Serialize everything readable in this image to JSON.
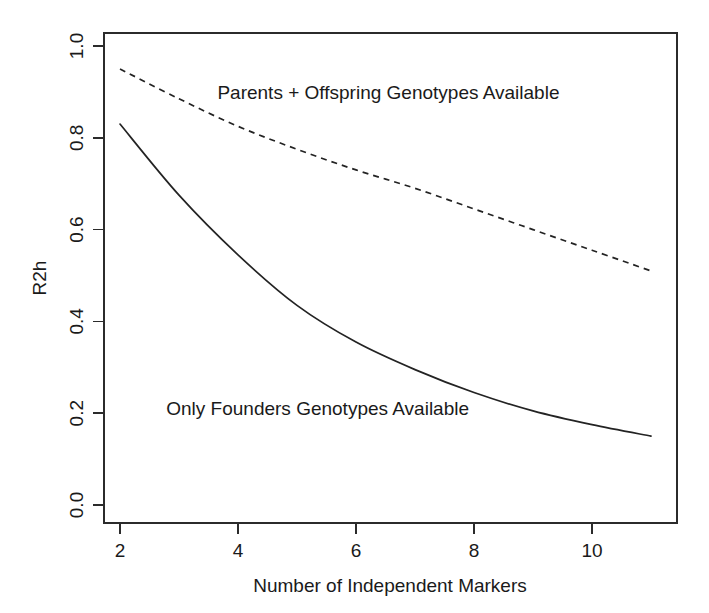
{
  "chart_data": {
    "type": "line",
    "title": "",
    "subtitle": "",
    "xlabel": "Number of Independent Markers",
    "ylabel": "R2h",
    "xlim": [
      1.85,
      11.0
    ],
    "ylim": [
      0.0,
      1.05
    ],
    "xticks": [
      2,
      4,
      6,
      8,
      10
    ],
    "xtick_labels": [
      "2",
      "4",
      "6",
      "8",
      "10"
    ],
    "yticks": [
      0.0,
      0.2,
      0.4,
      0.6,
      0.8,
      1.0
    ],
    "ytick_labels": [
      "0.0",
      "0.2",
      "0.4",
      "0.6",
      "0.8",
      "1.0"
    ],
    "grid": false,
    "legend_position": "inline-annotations",
    "x": [
      2,
      3,
      4,
      5,
      6,
      7,
      8,
      9,
      10,
      11
    ],
    "series": [
      {
        "name": "Parents + Offspring Genotypes Available",
        "style": "dashed",
        "color": "#232323",
        "values": [
          0.95,
          0.885,
          0.825,
          0.775,
          0.73,
          0.69,
          0.645,
          0.6,
          0.555,
          0.51
        ]
      },
      {
        "name": "Only Founders Genotypes Available",
        "style": "solid",
        "color": "#232323",
        "values": [
          0.83,
          0.675,
          0.545,
          0.435,
          0.355,
          0.295,
          0.245,
          0.205,
          0.175,
          0.15
        ]
      }
    ],
    "annotations": [
      {
        "id": "upper",
        "text": "Parents + Offspring Genotypes Available",
        "x": 6.55,
        "y": 0.885
      },
      {
        "id": "lower",
        "text": "Only Founders Genotypes Available",
        "x": 5.35,
        "y": 0.195
      }
    ]
  },
  "axes": {
    "y_axis_title": "R2h",
    "x_axis_title": "Number of Independent Markers"
  }
}
